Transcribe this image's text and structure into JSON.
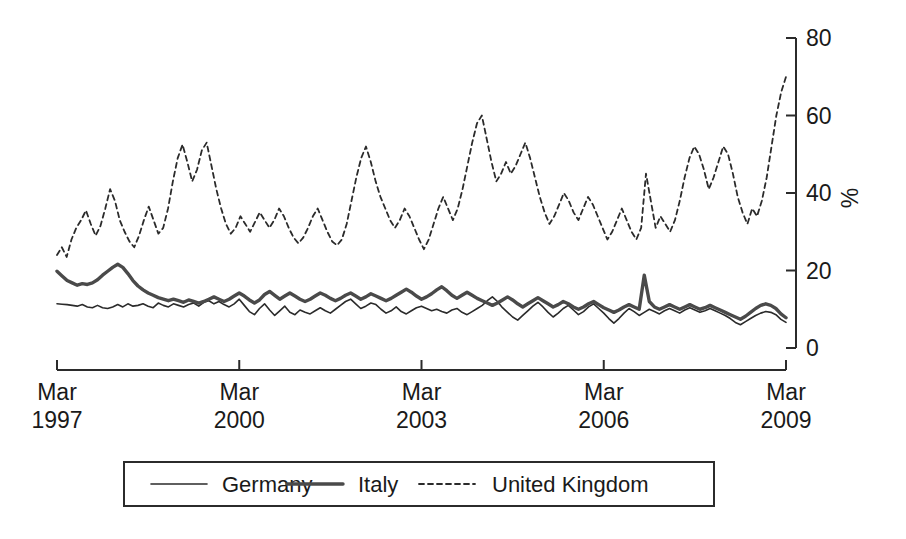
{
  "chart_data": {
    "type": "line",
    "title": "",
    "subtitle": "",
    "xlabel": "",
    "ylabel": "%",
    "ylim": [
      0,
      80
    ],
    "yticks": [
      0,
      20,
      40,
      60,
      80
    ],
    "ytick_labels": [
      "0",
      "20",
      "40",
      "60",
      "80"
    ],
    "y_axis_position": "right",
    "grid": false,
    "xlim": [
      "Mar 1997",
      "Mar 2009"
    ],
    "xticks": [
      0,
      36,
      72,
      108,
      144
    ],
    "xtick_labels": [
      {
        "month": "Mar",
        "year": "1997"
      },
      {
        "month": "Mar",
        "year": "2000"
      },
      {
        "month": "Mar",
        "year": "2003"
      },
      {
        "month": "Mar",
        "year": "2006"
      },
      {
        "month": "Mar",
        "year": "2009"
      }
    ],
    "legend": {
      "position": "bottom",
      "entries": [
        {
          "name": "Germany",
          "style": "solid-thin",
          "color": "#2b2b2b"
        },
        {
          "name": "Italy",
          "style": "solid-thick",
          "color": "#4a4a4a"
        },
        {
          "name": "United Kingdom",
          "style": "dashed",
          "color": "#2b2b2b"
        }
      ]
    },
    "x_unit": "months since Mar 1997",
    "n_points": 145,
    "series": [
      {
        "name": "Germany",
        "style": "solid-thin",
        "values": [
          11.4,
          11.3,
          11.2,
          11.0,
          10.8,
          11.2,
          10.6,
          10.4,
          11.0,
          10.4,
          10.2,
          10.6,
          11.2,
          10.6,
          11.4,
          10.8,
          11.0,
          11.4,
          10.8,
          10.4,
          11.6,
          11.0,
          10.6,
          11.4,
          11.0,
          10.6,
          11.2,
          11.6,
          10.8,
          11.8,
          12.2,
          11.4,
          12.0,
          11.2,
          10.6,
          11.4,
          12.6,
          11.0,
          9.4,
          8.6,
          10.2,
          11.4,
          9.8,
          8.4,
          9.6,
          10.8,
          9.2,
          8.6,
          9.8,
          9.2,
          8.8,
          9.6,
          10.4,
          9.6,
          9.0,
          10.0,
          11.0,
          12.0,
          12.6,
          11.4,
          10.2,
          10.8,
          11.6,
          11.2,
          10.0,
          9.0,
          9.6,
          10.6,
          9.4,
          8.8,
          9.6,
          10.4,
          10.8,
          10.2,
          9.6,
          10.0,
          9.4,
          9.0,
          9.8,
          10.2,
          9.2,
          8.6,
          9.4,
          10.2,
          11.0,
          12.2,
          13.2,
          12.0,
          10.4,
          9.2,
          8.0,
          7.2,
          8.4,
          9.6,
          10.8,
          11.8,
          10.6,
          9.2,
          8.0,
          9.0,
          10.2,
          11.0,
          9.8,
          8.6,
          9.4,
          10.6,
          11.4,
          10.2,
          9.0,
          7.6,
          6.4,
          7.6,
          9.0,
          10.2,
          9.4,
          8.4,
          9.2,
          10.0,
          9.4,
          8.8,
          9.6,
          10.2,
          9.6,
          9.0,
          9.8,
          10.4,
          9.8,
          9.2,
          9.6,
          10.2,
          9.6,
          9.0,
          8.4,
          7.6,
          6.6,
          6.0,
          6.8,
          7.6,
          8.4,
          9.0,
          9.4,
          9.2,
          8.6,
          7.4,
          6.6
        ]
      },
      {
        "name": "Italy",
        "style": "solid-thick",
        "values": [
          19.8,
          18.6,
          17.4,
          16.8,
          16.2,
          16.6,
          16.4,
          16.8,
          17.6,
          18.8,
          19.8,
          20.8,
          21.6,
          20.8,
          19.2,
          17.4,
          16.0,
          15.0,
          14.2,
          13.6,
          13.0,
          12.6,
          12.2,
          12.6,
          12.2,
          11.8,
          12.4,
          12.0,
          11.6,
          12.0,
          12.6,
          13.2,
          12.6,
          12.0,
          12.6,
          13.4,
          14.2,
          13.4,
          12.4,
          11.6,
          12.4,
          13.8,
          14.6,
          13.6,
          12.6,
          13.4,
          14.2,
          13.4,
          12.6,
          12.0,
          12.6,
          13.4,
          14.2,
          13.6,
          12.8,
          12.2,
          12.8,
          13.6,
          14.2,
          13.4,
          12.6,
          13.2,
          14.0,
          13.4,
          12.8,
          12.2,
          12.8,
          13.6,
          14.4,
          15.2,
          14.4,
          13.4,
          12.6,
          13.2,
          14.0,
          15.0,
          15.8,
          14.8,
          13.6,
          12.8,
          13.6,
          14.4,
          13.6,
          12.8,
          12.2,
          11.6,
          11.0,
          11.6,
          12.4,
          13.2,
          12.4,
          11.4,
          10.6,
          11.4,
          12.2,
          13.0,
          12.2,
          11.4,
          10.6,
          11.2,
          12.0,
          11.4,
          10.6,
          10.0,
          10.6,
          11.4,
          12.0,
          11.2,
          10.4,
          9.8,
          9.2,
          9.8,
          10.6,
          11.2,
          10.6,
          10.0,
          18.8,
          12.0,
          10.6,
          10.0,
          10.6,
          11.2,
          10.6,
          10.0,
          10.6,
          11.2,
          10.6,
          10.0,
          10.4,
          11.0,
          10.4,
          9.8,
          9.2,
          8.6,
          8.0,
          7.4,
          8.2,
          9.2,
          10.2,
          11.0,
          11.4,
          11.0,
          10.2,
          8.8,
          7.8
        ]
      },
      {
        "name": "United Kingdom",
        "style": "dashed",
        "values": [
          24.0,
          26.0,
          23.5,
          28.0,
          31.0,
          33.0,
          35.5,
          32.0,
          29.0,
          31.5,
          36.0,
          41.0,
          38.0,
          33.0,
          30.0,
          27.5,
          26.0,
          29.0,
          33.0,
          36.5,
          33.0,
          29.5,
          31.0,
          36.0,
          43.0,
          49.0,
          52.5,
          48.0,
          43.0,
          46.0,
          51.0,
          53.0,
          47.0,
          41.0,
          36.0,
          32.0,
          29.5,
          31.0,
          34.0,
          32.0,
          30.0,
          32.5,
          35.0,
          33.0,
          31.0,
          33.0,
          36.0,
          34.0,
          31.0,
          28.5,
          27.0,
          28.5,
          31.0,
          34.0,
          36.0,
          33.0,
          30.0,
          27.5,
          26.5,
          28.0,
          32.0,
          38.0,
          44.0,
          49.0,
          52.0,
          48.0,
          43.0,
          39.0,
          36.0,
          33.0,
          31.0,
          33.0,
          36.0,
          34.0,
          31.0,
          28.0,
          25.5,
          28.0,
          32.0,
          36.0,
          39.0,
          36.0,
          33.0,
          36.0,
          41.0,
          47.0,
          53.0,
          58.0,
          60.0,
          54.0,
          48.0,
          43.0,
          45.0,
          48.0,
          45.0,
          47.0,
          50.0,
          53.0,
          49.0,
          44.0,
          39.0,
          35.0,
          32.0,
          34.0,
          37.0,
          40.0,
          38.0,
          35.0,
          33.0,
          36.0,
          39.0,
          37.0,
          34.0,
          31.0,
          28.0,
          30.0,
          33.0,
          36.0,
          33.0,
          30.0,
          28.0,
          31.0,
          45.0,
          38.0,
          31.0,
          34.0,
          32.0,
          30.0,
          33.0,
          38.0,
          44.0,
          49.0,
          52.0,
          50.0,
          46.0,
          41.0,
          44.0,
          48.0,
          52.0,
          50.0,
          45.0,
          39.0,
          35.0,
          32.0,
          36.0,
          34.0,
          38.0,
          44.0,
          52.0,
          60.0,
          66.0,
          70.0
        ]
      }
    ]
  }
}
